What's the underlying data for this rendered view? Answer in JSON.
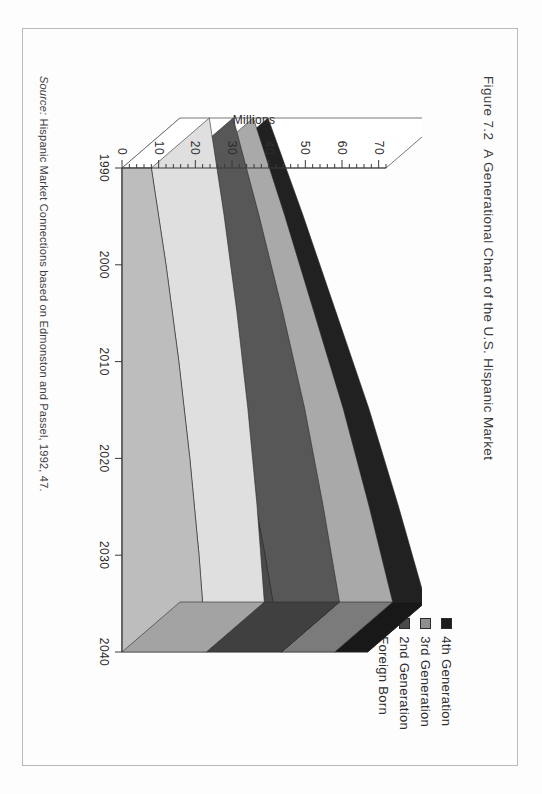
{
  "page": {
    "figure_number": "Figure 7.2",
    "figure_title": "A Generational Chart of the U.S. Hispanic Market",
    "source_word": "Source:",
    "source_text": "Hispanic Market Connections based on Edmonston and Passel, 1992, 47."
  },
  "legend": {
    "items": [
      {
        "label": "4th Generation",
        "color": "#1c1c1c"
      },
      {
        "label": "3rd Generation",
        "color": "#8f8f8f"
      },
      {
        "label": "2nd Generation",
        "color": "#4a4a4a"
      },
      {
        "label": "Foreign Born",
        "color": "#bdbdbd"
      }
    ]
  },
  "chart_data": {
    "type": "area",
    "subtype": "3d-stacked-area",
    "title": "A Generational Chart of the U.S. Hispanic Market",
    "xlabel": "",
    "ylabel": "Millions",
    "x": [
      1990,
      2000,
      2010,
      2020,
      2030,
      2040
    ],
    "categories": [
      "1990",
      "2000",
      "2010",
      "2020",
      "2030",
      "2040"
    ],
    "xtick_labels": [
      "1990",
      "2000",
      "2010",
      "2020",
      "2030",
      "2040"
    ],
    "ytick_labels": [
      "0",
      "10",
      "20",
      "30",
      "40",
      "50",
      "60",
      "70"
    ],
    "ytick_values": [
      0,
      10,
      20,
      30,
      40,
      50,
      60,
      70
    ],
    "yminor_step": 2,
    "ylim": [
      0,
      72
    ],
    "xlim": [
      1990,
      2040
    ],
    "grid": false,
    "legend_position": "top-right",
    "stack_order_bottom_to_top": [
      "Foreign Born",
      "2nd Generation",
      "3rd Generation",
      "4th Generation"
    ],
    "series": [
      {
        "name": "Foreign Born",
        "color": "#bdbdbd",
        "values": [
          8.0,
          12.0,
          15.5,
          18.5,
          21.0,
          23.0
        ]
      },
      {
        "name": "2nd Generation",
        "color": "#4a4a4a",
        "values": [
          6.5,
          9.5,
          12.5,
          15.5,
          18.0,
          20.5
        ]
      },
      {
        "name": "3rd Generation",
        "color": "#8f8f8f",
        "values": [
          5.5,
          7.0,
          8.5,
          10.5,
          12.5,
          14.5
        ]
      },
      {
        "name": "4th Generation",
        "color": "#1c1c1c",
        "values": [
          4.0,
          5.0,
          6.0,
          7.0,
          8.0,
          9.0
        ]
      }
    ],
    "totals": [
      24.0,
      33.5,
      42.5,
      51.5,
      59.5,
      67.0
    ],
    "units": "Millions"
  }
}
